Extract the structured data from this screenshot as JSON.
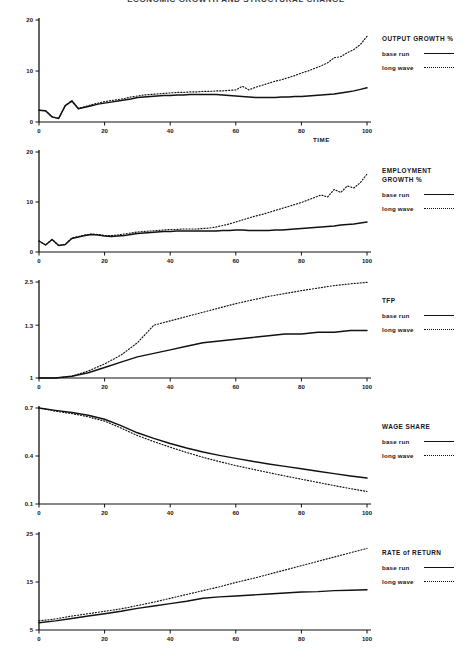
{
  "figure": {
    "title": "ECONOMIC GROWTH AND STRUCTURAL CHANGE",
    "title_note": "clipped at top edge of image",
    "xlabel": "TIME",
    "legend_series": [
      {
        "name": "base run",
        "style": "solid"
      },
      {
        "name": "long wave",
        "style": "dotted"
      }
    ]
  },
  "chart_data": [
    {
      "type": "line",
      "title": "OUTPUT GROWTH %",
      "panel_index": 0,
      "xlabel": "TIME",
      "ylabel": "",
      "xlim": [
        0,
        100
      ],
      "ylim": [
        0,
        20
      ],
      "xticks": [
        0,
        20,
        40,
        60,
        80,
        100
      ],
      "yticks": [
        0,
        10,
        20
      ],
      "grid": false,
      "legend_position": "right",
      "x": [
        0,
        2,
        4,
        6,
        8,
        10,
        12,
        14,
        16,
        18,
        20,
        22,
        24,
        26,
        28,
        30,
        32,
        34,
        36,
        38,
        40,
        42,
        44,
        46,
        48,
        50,
        52,
        54,
        56,
        58,
        60,
        62,
        64,
        66,
        68,
        70,
        72,
        74,
        76,
        78,
        80,
        82,
        84,
        86,
        88,
        90,
        92,
        94,
        96,
        98,
        100
      ],
      "series": [
        {
          "name": "base run",
          "style": "solid",
          "values": [
            2.3,
            2.2,
            1.0,
            0.7,
            3.2,
            4.1,
            2.6,
            2.9,
            3.2,
            3.5,
            3.7,
            3.9,
            4.1,
            4.3,
            4.5,
            4.8,
            4.9,
            5.0,
            5.1,
            5.2,
            5.2,
            5.3,
            5.3,
            5.4,
            5.4,
            5.4,
            5.4,
            5.4,
            5.3,
            5.2,
            5.1,
            5.0,
            4.9,
            4.8,
            4.8,
            4.8,
            4.8,
            4.9,
            4.9,
            5.0,
            5.0,
            5.1,
            5.2,
            5.3,
            5.4,
            5.5,
            5.7,
            5.9,
            6.1,
            6.4,
            6.7
          ]
        },
        {
          "name": "long wave",
          "style": "dotted",
          "values": [
            2.3,
            2.2,
            1.0,
            0.7,
            3.2,
            4.2,
            2.7,
            3.0,
            3.4,
            3.7,
            4.0,
            4.2,
            4.4,
            4.6,
            4.9,
            5.1,
            5.3,
            5.4,
            5.5,
            5.6,
            5.7,
            5.8,
            5.8,
            5.9,
            5.9,
            6.0,
            6.0,
            6.1,
            6.1,
            6.2,
            6.3,
            7.0,
            6.3,
            6.8,
            7.2,
            7.6,
            8.0,
            8.3,
            8.7,
            9.1,
            9.6,
            10.0,
            10.5,
            11.0,
            11.6,
            12.6,
            12.8,
            13.6,
            14.2,
            15.2,
            16.8
          ]
        }
      ]
    },
    {
      "type": "line",
      "title": "EMPLOYMENT GROWTH %",
      "title_lines": [
        "EMPLOYMENT",
        "GROWTH  %"
      ],
      "panel_index": 1,
      "xlabel": "",
      "ylabel": "",
      "xlim": [
        0,
        100
      ],
      "ylim": [
        0,
        20
      ],
      "xticks": [
        0,
        20,
        40,
        60,
        80,
        100
      ],
      "yticks": [
        0,
        10,
        20
      ],
      "grid": false,
      "legend_position": "right",
      "x": [
        0,
        2,
        4,
        6,
        8,
        10,
        12,
        14,
        16,
        18,
        20,
        22,
        24,
        26,
        28,
        30,
        32,
        34,
        36,
        38,
        40,
        42,
        44,
        46,
        48,
        50,
        52,
        54,
        56,
        58,
        60,
        62,
        64,
        66,
        68,
        70,
        72,
        74,
        76,
        78,
        80,
        82,
        84,
        86,
        88,
        90,
        92,
        94,
        96,
        98,
        100
      ],
      "series": [
        {
          "name": "base run",
          "style": "solid",
          "values": [
            2.2,
            1.4,
            2.5,
            1.3,
            1.5,
            2.7,
            3.0,
            3.3,
            3.5,
            3.4,
            3.2,
            3.1,
            3.2,
            3.3,
            3.5,
            3.7,
            3.8,
            3.9,
            4.0,
            4.1,
            4.1,
            4.2,
            4.2,
            4.2,
            4.2,
            4.2,
            4.2,
            4.2,
            4.3,
            4.3,
            4.4,
            4.4,
            4.3,
            4.3,
            4.3,
            4.3,
            4.4,
            4.4,
            4.5,
            4.6,
            4.7,
            4.8,
            4.9,
            5.0,
            5.1,
            5.2,
            5.4,
            5.5,
            5.6,
            5.8,
            6.0
          ]
        },
        {
          "name": "long wave",
          "style": "dotted",
          "values": [
            2.2,
            1.4,
            2.5,
            1.3,
            1.5,
            2.8,
            3.1,
            3.4,
            3.6,
            3.5,
            3.3,
            3.3,
            3.4,
            3.6,
            3.8,
            4.0,
            4.1,
            4.2,
            4.3,
            4.4,
            4.5,
            4.5,
            4.6,
            4.6,
            4.6,
            4.7,
            4.8,
            5.0,
            5.3,
            5.6,
            6.0,
            6.4,
            6.8,
            7.2,
            7.5,
            7.9,
            8.3,
            8.7,
            9.1,
            9.5,
            9.9,
            10.4,
            10.9,
            11.4,
            11.0,
            12.5,
            11.9,
            13.2,
            12.8,
            13.9,
            15.6
          ]
        }
      ]
    },
    {
      "type": "line",
      "title": "TFP",
      "panel_index": 2,
      "xlabel": "",
      "ylabel": "",
      "xlim": [
        0,
        100
      ],
      "ylim": [
        1.0,
        2.5
      ],
      "xticks": [
        0,
        20,
        40,
        60,
        80,
        100
      ],
      "yticks": [
        1.0,
        1.3,
        2.5
      ],
      "ytick_positions_fraction": [
        0.0,
        0.55,
        1.0
      ],
      "grid": false,
      "legend_position": "right",
      "x": [
        0,
        5,
        10,
        15,
        20,
        25,
        30,
        35,
        40,
        45,
        50,
        55,
        60,
        65,
        70,
        75,
        80,
        85,
        90,
        95,
        100
      ],
      "series": [
        {
          "name": "base run",
          "style": "solid",
          "values": [
            1.0,
            1.0,
            1.01,
            1.03,
            1.06,
            1.09,
            1.12,
            1.14,
            1.16,
            1.18,
            1.2,
            1.21,
            1.22,
            1.23,
            1.24,
            1.25,
            1.25,
            1.26,
            1.26,
            1.27,
            1.27
          ]
        },
        {
          "name": "long wave",
          "style": "dotted",
          "values": [
            1.0,
            1.0,
            1.01,
            1.04,
            1.08,
            1.13,
            1.2,
            1.3,
            1.42,
            1.54,
            1.66,
            1.78,
            1.9,
            2.0,
            2.1,
            2.18,
            2.26,
            2.33,
            2.4,
            2.45,
            2.49
          ]
        }
      ]
    },
    {
      "type": "line",
      "title": "WAGE SHARE",
      "panel_index": 3,
      "xlabel": "",
      "ylabel": "",
      "xlim": [
        0,
        100
      ],
      "ylim": [
        0.1,
        0.7
      ],
      "xticks": [
        0,
        20,
        40,
        60,
        80,
        100
      ],
      "yticks": [
        0.1,
        0.4,
        0.7
      ],
      "grid": false,
      "legend_position": "right",
      "x": [
        0,
        5,
        10,
        15,
        20,
        25,
        30,
        35,
        40,
        45,
        50,
        55,
        60,
        65,
        70,
        75,
        80,
        85,
        90,
        95,
        100
      ],
      "series": [
        {
          "name": "base run",
          "style": "solid",
          "values": [
            0.7,
            0.685,
            0.672,
            0.655,
            0.63,
            0.59,
            0.545,
            0.51,
            0.478,
            0.45,
            0.425,
            0.404,
            0.385,
            0.367,
            0.35,
            0.335,
            0.32,
            0.305,
            0.29,
            0.275,
            0.262
          ]
        },
        {
          "name": "long wave",
          "style": "dotted",
          "values": [
            0.7,
            0.68,
            0.665,
            0.645,
            0.618,
            0.575,
            0.528,
            0.49,
            0.455,
            0.422,
            0.392,
            0.365,
            0.34,
            0.318,
            0.296,
            0.275,
            0.255,
            0.235,
            0.215,
            0.196,
            0.178
          ]
        }
      ]
    },
    {
      "type": "line",
      "title": "RATE of  RETURN",
      "panel_index": 4,
      "xlabel": "",
      "ylabel": "",
      "xlim": [
        0,
        100
      ],
      "ylim": [
        5,
        25
      ],
      "xticks": [
        0,
        20,
        40,
        60,
        80,
        100
      ],
      "yticks": [
        5,
        15,
        25
      ],
      "grid": false,
      "legend_position": "right",
      "x": [
        0,
        5,
        10,
        15,
        20,
        25,
        30,
        35,
        40,
        45,
        50,
        55,
        60,
        65,
        70,
        75,
        80,
        85,
        90,
        95,
        100
      ],
      "series": [
        {
          "name": "base run",
          "style": "solid",
          "values": [
            6.5,
            6.9,
            7.4,
            7.9,
            8.4,
            8.9,
            9.5,
            10.0,
            10.5,
            11.0,
            11.6,
            11.9,
            12.1,
            12.3,
            12.5,
            12.7,
            12.9,
            13.0,
            13.2,
            13.3,
            13.4
          ]
        },
        {
          "name": "long wave",
          "style": "dotted",
          "values": [
            6.9,
            7.3,
            7.9,
            8.4,
            8.9,
            9.4,
            10.1,
            10.8,
            11.6,
            12.4,
            13.2,
            14.0,
            14.9,
            15.7,
            16.6,
            17.5,
            18.4,
            19.3,
            20.2,
            21.1,
            22.0
          ]
        }
      ]
    }
  ]
}
